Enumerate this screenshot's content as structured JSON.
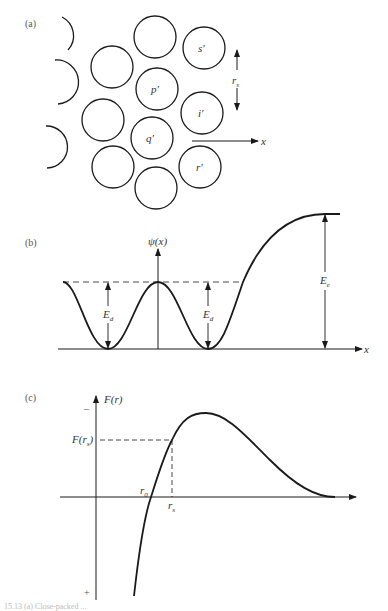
{
  "panels": {
    "a": {
      "label": "(a)",
      "atoms": [
        {
          "id": "top",
          "label": ""
        },
        {
          "id": "s",
          "label": "s′"
        },
        {
          "id": "upper-left",
          "label": ""
        },
        {
          "id": "p",
          "label": "p′"
        },
        {
          "id": "i",
          "label": "i′"
        },
        {
          "id": "mid-left",
          "label": ""
        },
        {
          "id": "q",
          "label": "q′"
        },
        {
          "id": "r",
          "label": "r′"
        },
        {
          "id": "lower-left",
          "label": ""
        },
        {
          "id": "bottom",
          "label": ""
        }
      ],
      "spacing_label": "r",
      "spacing_sub": "s",
      "x_axis_label": "x"
    },
    "b": {
      "label": "(b)",
      "y_axis_label": "ψ(x)",
      "x_axis_label": "x",
      "barrier_label": "E",
      "barrier_sub": "d",
      "escape_label": "E",
      "escape_sub": "e"
    },
    "c": {
      "label": "(c)",
      "y_axis_label": "F(r)",
      "y_minus": "–",
      "y_plus": "+",
      "frs_label": "F(r",
      "frs_sub": "s",
      "frs_close": ")",
      "r0_label": "r",
      "r0_sub": "0",
      "rs_label": "r",
      "rs_sub": "s"
    }
  },
  "caption": "15.13 (a) Close-packed ..."
}
